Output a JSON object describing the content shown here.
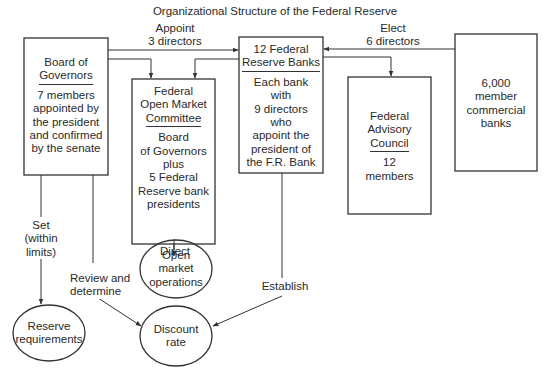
{
  "title": "Organizational Structure of the Federal Reserve",
  "nodes": {
    "board_of_governors": {
      "header_line1": "Board of",
      "header_line2": "Governors",
      "body": [
        "7 members",
        "appointed by",
        "the president",
        "and confirmed",
        "by the senate"
      ]
    },
    "fomc": {
      "header_line1": "Federal",
      "header_line2": "Open Market",
      "header_line3": "Committee",
      "body": [
        "Board",
        "of Governors",
        "plus",
        "5 Federal",
        "Reserve bank",
        "presidents"
      ]
    },
    "federal_reserve_banks": {
      "header_line1": "12 Federal",
      "header_line2": "Reserve Banks",
      "body": [
        "Each bank",
        "with",
        "9 directors",
        "who",
        "appoint the",
        "president of",
        "the F.R. Bank"
      ]
    },
    "federal_advisory_council": {
      "header_line1": "Federal",
      "header_line2": "Advisory",
      "header_line3": "Council",
      "body": [
        "12",
        "members"
      ]
    },
    "member_banks": {
      "body": [
        "6,000",
        "member",
        "commercial",
        "banks"
      ]
    },
    "reserve_requirements": {
      "line1": "Reserve",
      "line2": "requirements"
    },
    "open_market_operations": {
      "line1": "Open",
      "line2": "market",
      "line3": "operations"
    },
    "discount_rate": {
      "line1": "Discount",
      "line2": "rate"
    }
  },
  "edges": {
    "appoint": {
      "line1": "Appoint",
      "line2": "3 directors"
    },
    "elect": {
      "line1": "Elect",
      "line2": "6 directors"
    },
    "set": {
      "line1": "Set",
      "line2": "(within",
      "line3": "limits)"
    },
    "review": {
      "line1": "Review and",
      "line2": "determine"
    },
    "direct": {
      "line1": "Direct"
    },
    "establish": {
      "line1": "Establish"
    }
  },
  "colors": {
    "line": "#333333",
    "text": "#2a2a2a",
    "background": "#ffffff"
  }
}
